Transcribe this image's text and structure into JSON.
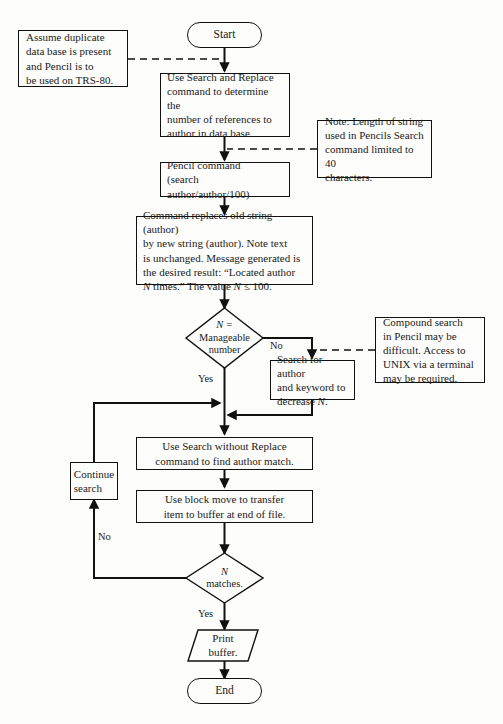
{
  "diagram": {
    "stroke_color": "#111111",
    "background_color": "#fdfdfc"
  },
  "nodes": {
    "start": {
      "label": "Start",
      "shape": "terminator"
    },
    "search_replace": {
      "shape": "process",
      "lines": [
        "Use Search and Replace",
        "command to determine the",
        "number of references to",
        "author in data base."
      ]
    },
    "pencil_command": {
      "shape": "process",
      "lines": [
        "Pencil command",
        "(search author/author/100)"
      ]
    },
    "command_replaces": {
      "shape": "process",
      "lines": [
        "Command replaces old string (author)",
        "by new string (author).  Note text",
        "is unchanged.  Message generated is",
        "the desired result:  “Located author",
        "N times.”  The value N ≤ 100."
      ],
      "italic_tokens": [
        "N"
      ]
    },
    "decision_manageable": {
      "shape": "decision",
      "lines": [
        "N =",
        "Manageable",
        "number"
      ],
      "italic_first_line": true
    },
    "search_keyword": {
      "shape": "process",
      "lines": [
        "Search for author",
        "and keyword to",
        "decrease N."
      ]
    },
    "search_without_replace": {
      "shape": "process",
      "lines": [
        "Use Search without Replace",
        "command to find author match."
      ]
    },
    "block_move": {
      "shape": "process",
      "lines": [
        "Use block move to transfer",
        "item to buffer at end of file."
      ]
    },
    "continue_search": {
      "shape": "process",
      "lines": [
        "Continue",
        "search"
      ]
    },
    "decision_matches": {
      "shape": "decision",
      "lines": [
        "N",
        "matches."
      ],
      "italic_first_line": true
    },
    "print_buffer": {
      "shape": "io-parallelogram",
      "lines": [
        "Print",
        "buffer."
      ]
    },
    "end": {
      "label": "End",
      "shape": "terminator"
    }
  },
  "annotations": {
    "assume_duplicate": {
      "lines": [
        "Assume duplicate",
        "data base is present",
        "and Pencil is to",
        "be used on TRS-80."
      ]
    },
    "note_length": {
      "lines": [
        "Note:  Length of string",
        "used in Pencils Search",
        "command limited to 40",
        "characters."
      ]
    },
    "compound_search": {
      "lines": [
        "Compound search",
        "in Pencil may be",
        "difficult.  Access to",
        "UNIX via a terminal",
        "may be required."
      ]
    }
  },
  "edge_labels": {
    "no_manageable": "No",
    "yes_manageable": "Yes",
    "no_matches": "No",
    "yes_matches": "Yes"
  }
}
